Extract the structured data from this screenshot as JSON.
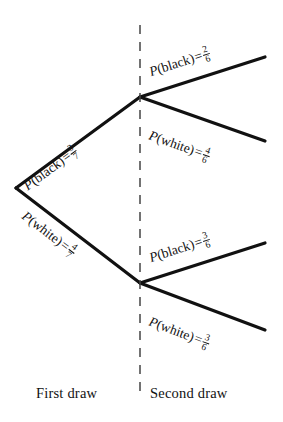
{
  "diagram": {
    "background_color": "#ffffff",
    "line_color": "#111111",
    "divider": {
      "name": "draw-separator",
      "style": "dashed",
      "x": 140,
      "y_top": 25,
      "y_bottom": 396
    },
    "nodes": [
      {
        "id": "root",
        "x": 16,
        "y": 188
      },
      {
        "id": "black-node",
        "x": 140,
        "y": 97
      },
      {
        "id": "white-node",
        "x": 140,
        "y": 283
      }
    ],
    "branches": [
      {
        "id": "first-black",
        "stage": "first",
        "outcome": "black",
        "label_prefix": "P",
        "label_open": "(",
        "label_event": "black",
        "label_close": ")",
        "equals": "=",
        "numerator": "3",
        "denominator": "7",
        "probability_text": "3/7",
        "from": "root",
        "to": "black-node"
      },
      {
        "id": "first-white",
        "stage": "first",
        "outcome": "white",
        "label_prefix": "P",
        "label_open": "(",
        "label_event": "white",
        "label_close": ")",
        "equals": "=",
        "numerator": "4",
        "denominator": "7",
        "probability_text": "4/7",
        "from": "root",
        "to": "white-node"
      },
      {
        "id": "second-black-black",
        "stage": "second",
        "outcome": "black",
        "label_prefix": "P",
        "label_open": "(",
        "label_event": "black",
        "label_close": ")",
        "equals": "=",
        "numerator": "2",
        "denominator": "6",
        "probability_text": "2/6",
        "from": "black-node",
        "to": "endpoint-1"
      },
      {
        "id": "second-black-white",
        "stage": "second",
        "outcome": "white",
        "label_prefix": "P",
        "label_open": "(",
        "label_event": "white",
        "label_close": ")",
        "equals": "=",
        "numerator": "4",
        "denominator": "6",
        "probability_text": "4/6",
        "from": "black-node",
        "to": "endpoint-2"
      },
      {
        "id": "second-white-black",
        "stage": "second",
        "outcome": "black",
        "label_prefix": "P",
        "label_open": "(",
        "label_event": "black",
        "label_close": ")",
        "equals": "=",
        "numerator": "3",
        "denominator": "6",
        "probability_text": "3/6",
        "from": "white-node",
        "to": "endpoint-3"
      },
      {
        "id": "second-white-white",
        "stage": "second",
        "outcome": "white",
        "label_prefix": "P",
        "label_open": "(",
        "label_event": "white",
        "label_close": ")",
        "equals": "=",
        "numerator": "3",
        "denominator": "6",
        "probability_text": "3/6",
        "from": "white-node",
        "to": "endpoint-4"
      }
    ],
    "axis_labels": {
      "first": "First draw",
      "second": "Second draw"
    }
  }
}
